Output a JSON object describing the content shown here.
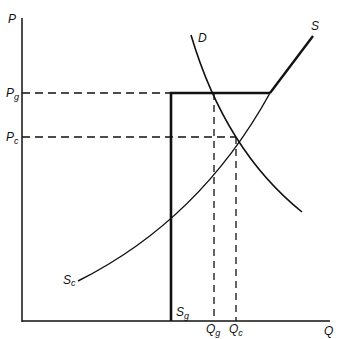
{
  "diagram": {
    "type": "supply-demand",
    "axes": {
      "y_label": "P",
      "x_label": "Q"
    },
    "price_levels": [
      {
        "label_base": "P",
        "label_sub": "g",
        "name": "government price"
      },
      {
        "label_base": "P",
        "label_sub": "c",
        "name": "competitive price"
      }
    ],
    "quantity_levels": [
      {
        "label_base": "Q",
        "label_sub": "g"
      },
      {
        "label_base": "Q",
        "label_sub": "c"
      }
    ],
    "curves": {
      "demand": {
        "label": "D"
      },
      "supply": {
        "label": "S"
      },
      "supply_competitive": {
        "label_base": "S",
        "label_sub": "c"
      },
      "supply_government": {
        "label_base": "S",
        "label_sub": "g"
      }
    },
    "colors": {
      "line": "#111111",
      "background": "#ffffff"
    }
  }
}
